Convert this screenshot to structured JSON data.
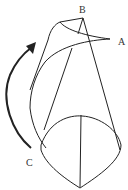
{
  "diagram": {
    "type": "cone-rolling-surface",
    "labels": {
      "A": "A",
      "B": "B",
      "C": "C"
    },
    "arrow": {
      "direction": "counterclockwise",
      "meaning": "rotation"
    },
    "colors": {
      "stroke": "#222222",
      "background": "#ffffff",
      "label": "#333333"
    }
  }
}
